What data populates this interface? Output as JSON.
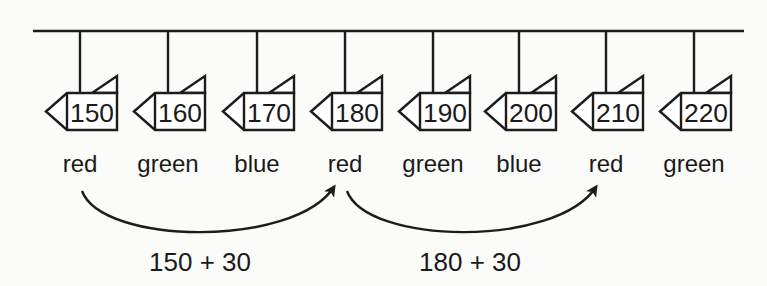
{
  "diagram": {
    "rail": {
      "x1": 33,
      "x2": 744,
      "y": 31
    },
    "items": [
      {
        "value": "150",
        "color": "red",
        "x": 80
      },
      {
        "value": "160",
        "color": "green",
        "x": 168
      },
      {
        "value": "170",
        "color": "blue",
        "x": 257
      },
      {
        "value": "180",
        "color": "red",
        "x": 345
      },
      {
        "value": "190",
        "color": "green",
        "x": 433
      },
      {
        "value": "200",
        "color": "blue",
        "x": 519
      },
      {
        "value": "210",
        "color": "red",
        "x": 606
      },
      {
        "value": "220",
        "color": "green",
        "x": 694
      }
    ],
    "arrows": [
      {
        "label": "150 + 30",
        "from_x": 82,
        "to_x": 334,
        "label_x": 200
      },
      {
        "label": "180 + 30",
        "from_x": 347,
        "to_x": 596,
        "label_x": 470
      }
    ],
    "stroke_color": "#1c1c1c"
  }
}
